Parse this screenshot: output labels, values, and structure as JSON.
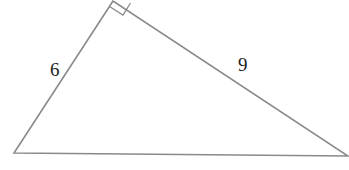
{
  "diagram": {
    "type": "right-triangle",
    "stroke_color": "#8a8a8a",
    "label_color": "#222222",
    "vertices": {
      "apex": [
        113,
        1
      ],
      "left": [
        14,
        153
      ],
      "right": [
        348,
        156
      ]
    },
    "right_angle_marker": {
      "at": "apex"
    },
    "labels": {
      "left_leg": "6",
      "right_leg": "9"
    }
  }
}
